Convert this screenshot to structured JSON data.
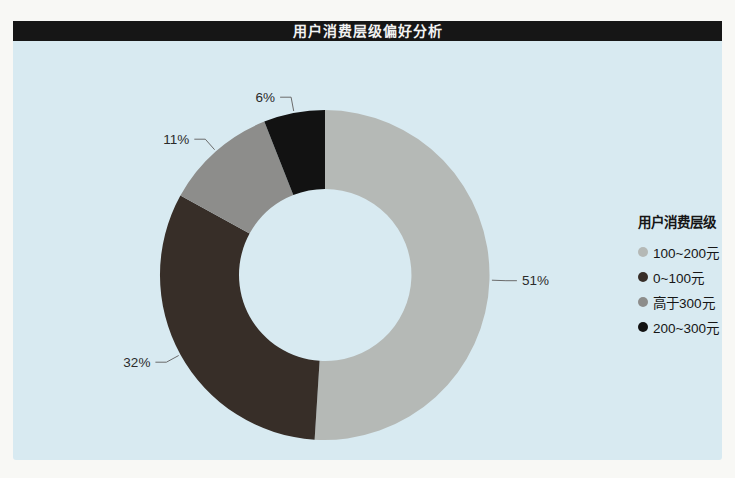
{
  "chart_data": {
    "type": "pie",
    "subtype": "donut",
    "title": "用户消费层级偏好分析",
    "legend_title": "用户消费层级",
    "legend_position": "right",
    "direction": "clockwise",
    "start_angle": "top",
    "inner_radius_ratio": 0.52,
    "value_unit": "%",
    "slices": [
      {
        "label": "100~200元",
        "value": 51,
        "color": "#b5b9b6"
      },
      {
        "label": "0~100元",
        "value": 32,
        "color": "#372e28"
      },
      {
        "label": "高于300元",
        "value": 11,
        "color": "#8d8d8b"
      },
      {
        "label": "200~300元",
        "value": 6,
        "color": "#121212"
      }
    ],
    "colors": {
      "background": "#d8eaf1",
      "title_bar": "#161616",
      "title_text": "#f2f2f2",
      "label_text": "#2b2b2b",
      "leader_line": "#6b6b6b",
      "legend_text": "#161616"
    }
  }
}
